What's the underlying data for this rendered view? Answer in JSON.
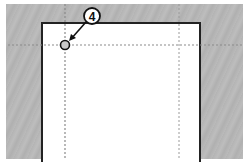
{
  "diagram": {
    "callout": {
      "number": "4"
    },
    "guides": {
      "vertical_x": [
        65,
        179
      ],
      "horizontal_y": [
        45
      ]
    },
    "colors": {
      "pasteboard": "#b8b8b8",
      "page": "#ffffff",
      "page_border": "#222222",
      "guide": "#888888",
      "callout_border": "#111111"
    }
  }
}
